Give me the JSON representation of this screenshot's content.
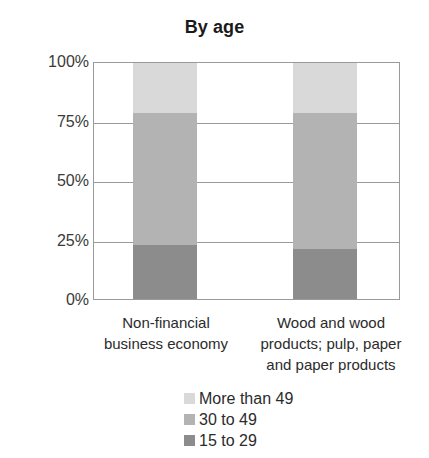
{
  "chart_data": {
    "type": "bar",
    "title": "By age",
    "xlabel": "",
    "ylabel": "",
    "ylim": [
      0,
      100
    ],
    "stacked": true,
    "stack_total": 100,
    "grid": true,
    "legend_position": "bottom",
    "y_ticks": [
      "0%",
      "25%",
      "50%",
      "75%",
      "100%"
    ],
    "y_tick_values": [
      0,
      25,
      50,
      75,
      100
    ],
    "categories": [
      "Non-financial business economy",
      "Wood and wood products; pulp, paper and paper products"
    ],
    "category_label_lines": [
      [
        "Non-financial",
        "business economy"
      ],
      [
        "Wood and wood",
        "products; pulp, paper",
        "and paper products"
      ]
    ],
    "series": [
      {
        "name": "15 to 29",
        "color": "#8c8c8c",
        "values": [
          23,
          21
        ]
      },
      {
        "name": "30 to 49",
        "color": "#b3b3b3",
        "values": [
          56,
          58
        ]
      },
      {
        "name": "More than 49",
        "color": "#d9d9d9",
        "values": [
          21,
          21
        ]
      }
    ],
    "legend": [
      {
        "label": "More than 49",
        "color": "#d9d9d9"
      },
      {
        "label": "30 to 49",
        "color": "#b3b3b3"
      },
      {
        "label": "15 to 29",
        "color": "#8c8c8c"
      }
    ]
  }
}
